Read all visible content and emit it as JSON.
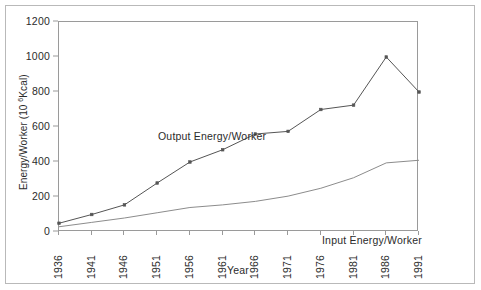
{
  "chart_data": {
    "type": "line",
    "title": "",
    "xlabel": "Year",
    "ylabel": "Energy/Worker  (10 ⁶Kcal)",
    "ylabel_base": "Energy/Worker  (10 ",
    "ylabel_exponent": "6",
    "ylabel_tail": "Kcal)",
    "categories": [
      "1936",
      "1941",
      "1946",
      "1951",
      "1956",
      "1961",
      "1966",
      "1971",
      "1976",
      "1981",
      "1986",
      "1991"
    ],
    "x": [
      1936,
      1941,
      1946,
      1951,
      1956,
      1961,
      1966,
      1971,
      1976,
      1981,
      1986,
      1991
    ],
    "ylim": [
      0,
      1200
    ],
    "xlim": [
      1936,
      1991
    ],
    "yticks": [
      0,
      200,
      400,
      600,
      800,
      1000,
      1200
    ],
    "ytick_labels": [
      "0",
      "200",
      "400",
      "600",
      "800",
      "1000",
      "1200"
    ],
    "grid": false,
    "legend_position": "inline-annotations",
    "series": [
      {
        "name": "Output Energy/Worker",
        "label_text": "Output Energy/Worker",
        "color": "#555555",
        "marker": "square",
        "values": [
          50,
          100,
          155,
          280,
          400,
          470,
          560,
          575,
          700,
          725,
          1000,
          800
        ]
      },
      {
        "name": "Input Energy/Worker",
        "label_text": "Input Energy/Worker",
        "color": "#8c8c8c",
        "marker": "none",
        "values": [
          30,
          55,
          80,
          110,
          140,
          155,
          175,
          205,
          250,
          310,
          395,
          410
        ]
      }
    ],
    "annotations": [
      {
        "text": "Output Energy/Worker",
        "x": 1943,
        "y": 640
      },
      {
        "text": "Input Energy/Worker",
        "x": 1975,
        "y": 95
      }
    ]
  },
  "figure": {
    "background_color": "#ffffff",
    "frame_color": "#b9b9b9",
    "axis_color": "#9a9a9a",
    "text_color": "#2b2b2b"
  }
}
